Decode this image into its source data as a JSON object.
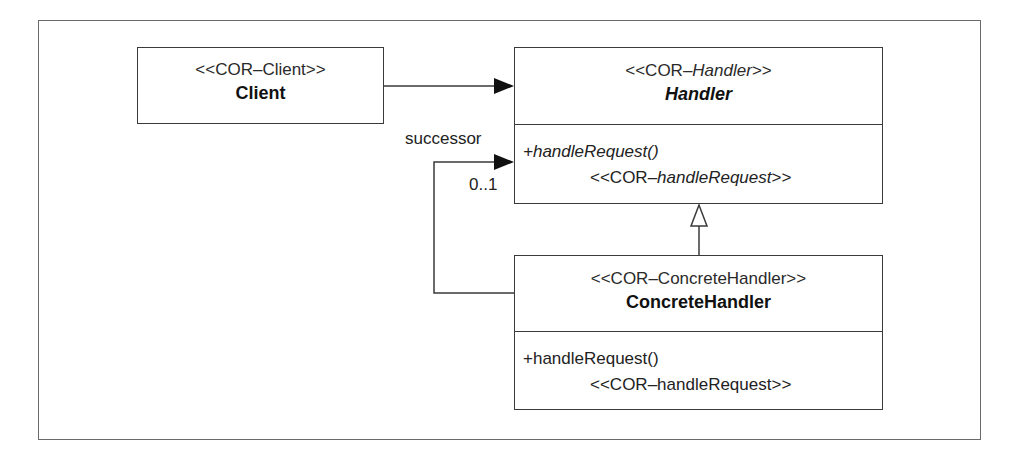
{
  "diagram": {
    "type": "UML class diagram",
    "classes": {
      "client": {
        "stereotype": "<<COR–Client>>",
        "name": "Client"
      },
      "handler": {
        "stereotype_prefix": "<<COR–",
        "stereotype_italic": "Handler",
        "stereotype_suffix": ">>",
        "name": "Handler",
        "abstract": true,
        "operation": "+handleRequest()",
        "operation_stereotype_prefix": "<<COR–",
        "operation_stereotype_italic": "handleRequest",
        "operation_stereotype_suffix": ">>"
      },
      "concrete_handler": {
        "stereotype": "<<COR–ConcreteHandler>>",
        "name": "ConcreteHandler",
        "operation": "+handleRequest()",
        "operation_stereotype": "<<COR–handleRequest>>"
      }
    },
    "associations": {
      "successor": {
        "role": "successor",
        "multiplicity": "0..1"
      }
    },
    "colors": {
      "line": "#3a3a3a",
      "frame": "#6a6a6a",
      "background": "#ffffff"
    }
  }
}
